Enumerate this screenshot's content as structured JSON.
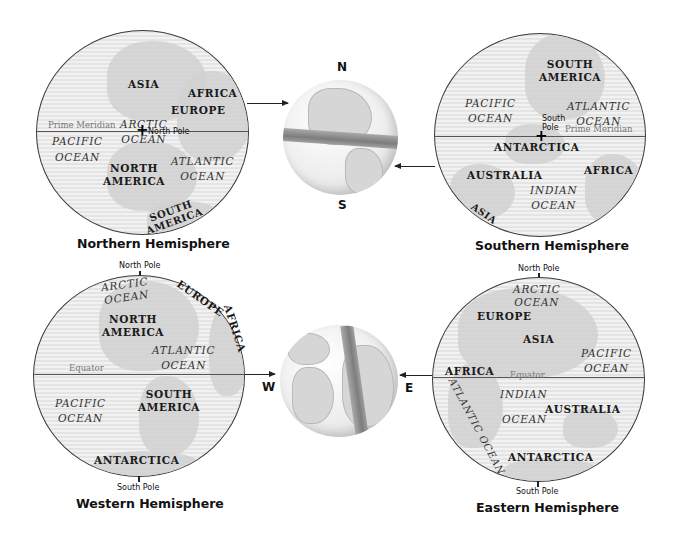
{
  "northern": {
    "caption": "Northern Hemisphere",
    "reference_line": "Prime Meridian",
    "pole_label": "North Pole",
    "continents": [
      "ASIA",
      "AFRICA",
      "EUROPE",
      "NORTH",
      "AMERICA",
      "SOUTH",
      "AMERICA"
    ],
    "oceans": {
      "arctic": [
        "ARCTIC",
        "OCEAN"
      ],
      "pacific": [
        "PACIFIC",
        "OCEAN"
      ],
      "atlantic": [
        "ATLANTIC",
        "OCEAN"
      ]
    }
  },
  "southern": {
    "caption": "Southern Hemisphere",
    "reference_line": "Prime Meridian",
    "pole_label": [
      "South",
      "Pole"
    ],
    "continents": [
      "SOUTH",
      "AMERICA",
      "ANTARCTICA",
      "AUSTRALIA",
      "AFRICA",
      "ASIA"
    ],
    "oceans": {
      "pacific": [
        "PACIFIC",
        "OCEAN"
      ],
      "atlantic": [
        "ATLANTIC",
        "OCEAN"
      ],
      "indian": [
        "INDIAN",
        "OCEAN"
      ]
    }
  },
  "western": {
    "caption": "Western Hemisphere",
    "reference_line": "Equator",
    "top_label": "North Pole",
    "bottom_label": "South Pole",
    "continents": [
      "NORTH",
      "AMERICA",
      "EUROPE",
      "AFRICA",
      "SOUTH",
      "AMERICA",
      "ANTARCTICA"
    ],
    "oceans": {
      "arctic": [
        "ARCTIC",
        "OCEAN"
      ],
      "atlantic": [
        "ATLANTIC",
        "OCEAN"
      ],
      "pacific": [
        "PACIFIC",
        "OCEAN"
      ]
    }
  },
  "eastern": {
    "caption": "Eastern Hemisphere",
    "reference_line": "Equator",
    "top_label": "North Pole",
    "bottom_label": "South Pole",
    "continents": [
      "EUROPE",
      "ASIA",
      "AFRICA",
      "AUSTRALIA",
      "ANTARCTICA"
    ],
    "oceans": {
      "arctic": [
        "ARCTIC",
        "OCEAN"
      ],
      "pacific": [
        "PACIFIC",
        "OCEAN"
      ],
      "indian": [
        "INDIAN",
        "OCEAN"
      ],
      "atlantic": "ATLANTIC OCEAN"
    }
  },
  "globe_ns": {
    "north": "N",
    "south": "S"
  },
  "globe_we": {
    "west": "W",
    "east": "E"
  }
}
